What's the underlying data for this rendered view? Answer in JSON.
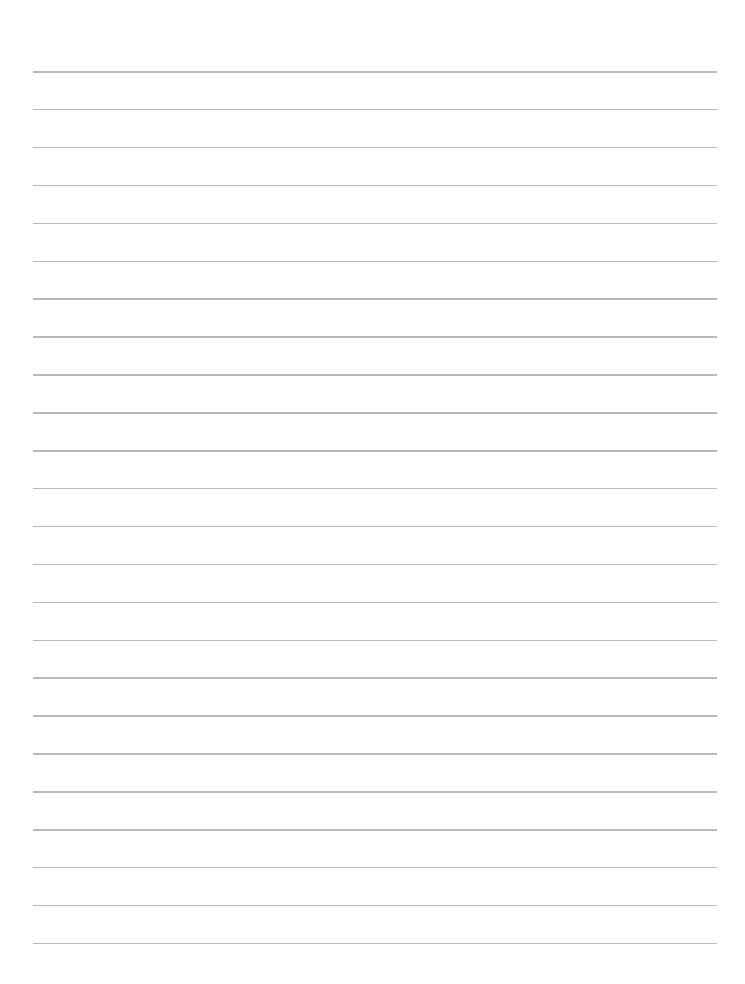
{
  "document": {
    "type": "lined-paper",
    "background_color": "#ffffff",
    "line_color": "#b9b9b9",
    "line_count": 24,
    "first_line_y": 71,
    "line_spacing": 37.9,
    "line_left": 33,
    "line_right": 717
  }
}
